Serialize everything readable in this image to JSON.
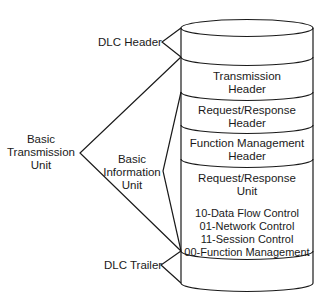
{
  "diagram": {
    "type": "stacked-cylinder",
    "stroke_color": "#1a1a1a",
    "background": "#ffffff",
    "cylinder": {
      "layers": [
        {
          "id": "dlc-header",
          "lines": []
        },
        {
          "id": "transmission-header",
          "lines": [
            "Transmission",
            "Header"
          ]
        },
        {
          "id": "rr-header",
          "lines": [
            "Request/Response",
            "Header"
          ]
        },
        {
          "id": "fm-header",
          "lines": [
            "Function Management",
            "Header"
          ]
        },
        {
          "id": "ru",
          "lines": [
            "Request/Response",
            "Unit",
            "",
            "10-Data Flow Control",
            "01-Network Control",
            "11-Session Control",
            "00-Function Management"
          ]
        },
        {
          "id": "dlc-trailer",
          "lines": []
        }
      ]
    },
    "brackets": {
      "dlc_header": {
        "label": "DLC Header"
      },
      "btu": {
        "label_lines": [
          "Basic",
          "Transmission",
          "Unit"
        ]
      },
      "biu": {
        "label_lines": [
          "Basic",
          "Information",
          "Unit"
        ]
      },
      "dlc_trailer": {
        "label": "DLC Trailer"
      }
    }
  }
}
